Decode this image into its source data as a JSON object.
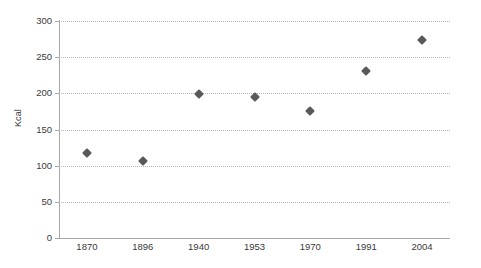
{
  "chart_data": {
    "type": "scatter",
    "title": "",
    "subtitle": "",
    "xlabel": "",
    "ylabel": "Kcal",
    "categories": [
      "1870",
      "1896",
      "1940",
      "1953",
      "1970",
      "1991",
      "2004"
    ],
    "values": [
      118,
      107,
      199,
      195,
      175,
      231,
      274
    ],
    "series": [
      {
        "name": "Kcal",
        "values": [
          118,
          107,
          199,
          195,
          175,
          231,
          274
        ],
        "marker": "diamond",
        "color": "#595959"
      }
    ],
    "ylim": [
      0,
      300
    ],
    "y_ticks": [
      0,
      50,
      100,
      150,
      200,
      250,
      300
    ],
    "y_tick_labels": [
      "0",
      "50",
      "100",
      "150",
      "200",
      "250",
      "300"
    ],
    "x_tick_labels": [
      "1870",
      "1896",
      "1940",
      "1953",
      "1970",
      "1991",
      "2004"
    ],
    "grid": "horizontal-dotted",
    "legend": "none",
    "legend_position": "none",
    "background_color": "#ffffff",
    "axis_color": "#a6a6a6",
    "gridline_color": "#b9b9b9",
    "text_color": "#3a3a3a"
  }
}
